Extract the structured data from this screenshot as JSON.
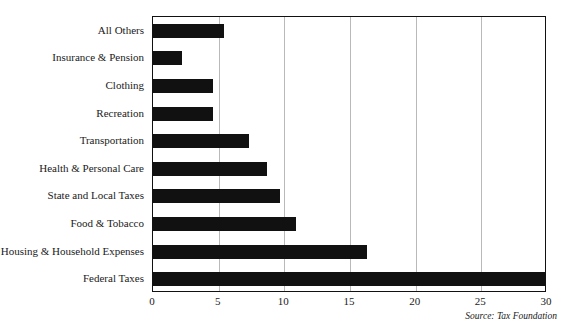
{
  "chart_data": {
    "type": "bar",
    "orientation": "horizontal",
    "title": "",
    "xlabel": "",
    "ylabel": "",
    "xlim": [
      0,
      30
    ],
    "grid": true,
    "legend": null,
    "bar_color": "#111111",
    "grid_color": "#b9b9b9",
    "axis_color": "#111111",
    "xticks": [
      "0",
      "5",
      "10",
      "15",
      "20",
      "25",
      "30"
    ],
    "xtick_values": [
      0,
      5,
      10,
      15,
      20,
      25,
      30
    ],
    "categories": [
      "All Others",
      "Insurance & Pension",
      "Clothing",
      "Recreation",
      "Transportation",
      "Health & Personal Care",
      "State and Local Taxes",
      "Food & Tobacco",
      "Housing & Household Expenses",
      "Federal Taxes"
    ],
    "values": [
      5.4,
      2.2,
      4.6,
      4.6,
      7.3,
      8.7,
      9.7,
      10.9,
      16.3,
      29.9
    ],
    "annotations": [
      "Source: Tax Foundation"
    ]
  },
  "footer": {
    "source": "Source: Tax Foundation"
  }
}
